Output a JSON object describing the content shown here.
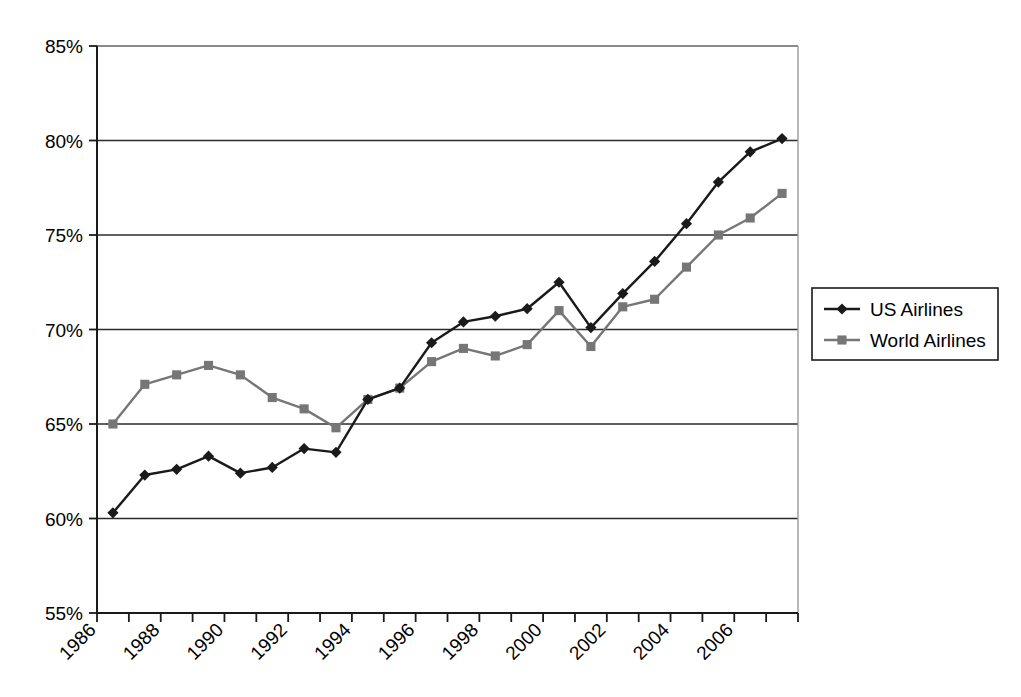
{
  "chart_data": {
    "type": "line",
    "title": "",
    "subtitle": "",
    "xlabel": "",
    "ylabel": "",
    "xlim": [
      1986,
      2007
    ],
    "ylim": [
      55,
      85
    ],
    "y_tick_labels": [
      "85%",
      "80%",
      "75%",
      "70%",
      "65%",
      "60%",
      "55%"
    ],
    "y_tick_values": [
      85,
      80,
      75,
      70,
      65,
      60,
      55
    ],
    "y_tick_interval": 5,
    "x_tick_labels": [
      "1986",
      "1988",
      "1990",
      "1992",
      "1994",
      "1996",
      "1998",
      "2000",
      "2002",
      "2004",
      "2006"
    ],
    "x_tick_label_values": [
      1986,
      1988,
      1990,
      1992,
      1994,
      1996,
      1998,
      2000,
      2002,
      2004,
      2006
    ],
    "x_minor_ticks_every_year": true,
    "x_tick_label_rotation_deg": -45,
    "grid": "horizontal",
    "legend_position": "right",
    "x": [
      1986,
      1987,
      1988,
      1989,
      1990,
      1991,
      1992,
      1993,
      1994,
      1995,
      1996,
      1997,
      1998,
      1999,
      2000,
      2001,
      2002,
      2003,
      2004,
      2005,
      2006,
      2007
    ],
    "series": [
      {
        "name": "US Airlines",
        "color": "#1a1a1a",
        "marker": "diamond",
        "values": [
          60.3,
          62.3,
          62.6,
          63.3,
          62.4,
          62.7,
          63.7,
          63.5,
          66.3,
          66.9,
          69.3,
          70.4,
          70.7,
          71.1,
          72.5,
          70.1,
          71.9,
          73.6,
          75.6,
          77.8,
          79.4,
          80.1
        ]
      },
      {
        "name": "World Airlines",
        "color": "#767676",
        "marker": "square",
        "values": [
          65.0,
          67.1,
          67.6,
          68.1,
          67.6,
          66.4,
          65.8,
          64.8,
          66.3,
          66.9,
          68.3,
          69.0,
          68.6,
          69.2,
          71.0,
          69.1,
          71.2,
          71.6,
          73.3,
          75.0,
          75.9,
          77.2
        ]
      }
    ]
  },
  "legend": {
    "entries": [
      {
        "label": "US Airlines"
      },
      {
        "label": "World Airlines"
      }
    ]
  }
}
